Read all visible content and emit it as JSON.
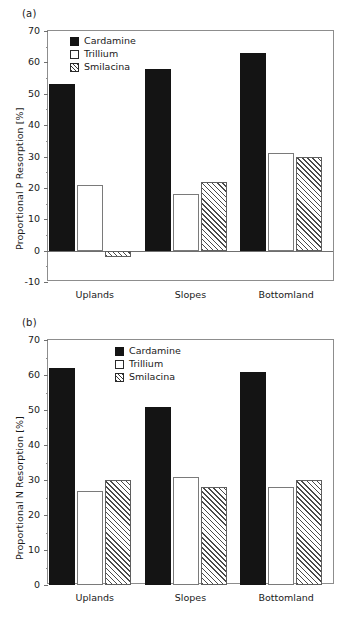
{
  "figure": {
    "panels": [
      {
        "id": "a",
        "label": "(a)",
        "ylabel": "Proportional P Resorption [%]"
      },
      {
        "id": "b",
        "label": "(b)",
        "ylabel": "Proportional N Resorption [%]"
      }
    ]
  },
  "chart_data": [
    {
      "type": "bar",
      "panel": "(a)",
      "title": "",
      "xlabel": "",
      "ylabel": "Proportional P Resorption [%]",
      "categories": [
        "Uplands",
        "Slopes",
        "Bottomland"
      ],
      "series": [
        {
          "name": "Cardamine",
          "values": [
            53,
            58,
            63
          ],
          "fill": "solid-black"
        },
        {
          "name": "Trillium",
          "values": [
            21,
            18,
            31
          ],
          "fill": "open-white"
        },
        {
          "name": "Smilacina",
          "values": [
            -2,
            22,
            30
          ],
          "fill": "diagonal-hatch"
        }
      ],
      "ylim": [
        -10,
        70
      ],
      "yticks": [
        -10,
        0,
        10,
        20,
        30,
        40,
        50,
        60,
        70
      ],
      "ytick_labels": [
        "-10",
        "0",
        "10",
        "20",
        "30",
        "40",
        "50",
        "60",
        "70"
      ],
      "grid": false,
      "legend_position": "top-left",
      "zero_line": true
    },
    {
      "type": "bar",
      "panel": "(b)",
      "title": "",
      "xlabel": "",
      "ylabel": "Proportional N Resorption [%]",
      "categories": [
        "Uplands",
        "Slopes",
        "Bottomland"
      ],
      "series": [
        {
          "name": "Cardamine",
          "values": [
            62,
            51,
            61
          ],
          "fill": "solid-black"
        },
        {
          "name": "Trillium",
          "values": [
            27,
            31,
            28
          ],
          "fill": "open-white"
        },
        {
          "name": "Smilacina",
          "values": [
            30,
            28,
            30
          ],
          "fill": "diagonal-hatch"
        }
      ],
      "ylim": [
        0,
        70
      ],
      "yticks": [
        0,
        10,
        20,
        30,
        40,
        50,
        60,
        70
      ],
      "ytick_labels": [
        "0",
        "10",
        "20",
        "30",
        "40",
        "50",
        "60",
        "70"
      ],
      "grid": false,
      "legend_position": "top-center",
      "zero_line": false
    }
  ]
}
